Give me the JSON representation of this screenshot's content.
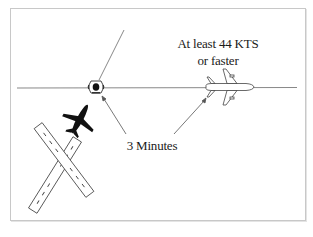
{
  "diagram": {
    "speed_label_line1": "At least 44 KTS",
    "speed_label_line2": "or faster",
    "time_label": "3 Minutes",
    "elements": {
      "vor_station": "vor-icon",
      "departing_aircraft": "airplane-black-icon",
      "enroute_aircraft": "airplane-white-icon",
      "runways": "crossing-runways",
      "course_line": "horizontal-radial",
      "secondary_radial": "diagonal-radial"
    },
    "colors": {
      "line": "#555555",
      "frame": "#c8c8c8",
      "aircraft_dark": "#111111",
      "text": "#1a1a1a"
    }
  }
}
